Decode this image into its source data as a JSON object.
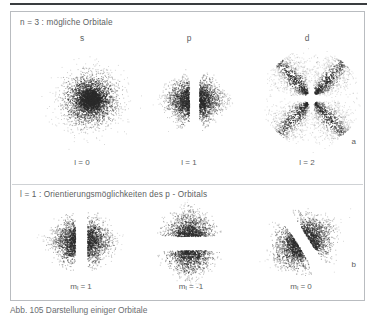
{
  "figure": {
    "top_rule": true,
    "caption": "Abb. 105  Darstellung einiger Orbitale",
    "border_color": "#b9bcc0",
    "text_color": "#55585b",
    "dot_color": "#2a2a2a"
  },
  "section_a": {
    "panel_letter": "a",
    "heading": "n = 3 : mögliche Orbitale",
    "columns": [
      {
        "letter": "s",
        "quantum_label": "l = 0",
        "orbital_type": "s-orbital-sphere"
      },
      {
        "letter": "p",
        "quantum_label": "l = 1",
        "orbital_type": "p-orbital-dumbbell-horizontal"
      },
      {
        "letter": "d",
        "quantum_label": "l = 2",
        "orbital_type": "d-orbital-cloverleaf"
      }
    ]
  },
  "section_b": {
    "panel_letter": "b",
    "heading": "l = 1 : Orientierungsmöglichkeiten des  p - Orbitals",
    "columns": [
      {
        "magnetic_label_prefix": "m",
        "magnetic_label_sub": "l",
        "magnetic_label_value": "= 1",
        "orientation": "horizontal",
        "orbital_type": "p-orbital-dumbbell-horizontal"
      },
      {
        "magnetic_label_prefix": "m",
        "magnetic_label_sub": "l",
        "magnetic_label_value": "= -1",
        "orientation": "vertical",
        "orbital_type": "p-orbital-dumbbell-vertical"
      },
      {
        "magnetic_label_prefix": "m",
        "magnetic_label_sub": "l",
        "magnetic_label_value": "= 0",
        "orientation": "diagonal",
        "orbital_type": "p-orbital-dumbbell-diagonal"
      }
    ]
  }
}
